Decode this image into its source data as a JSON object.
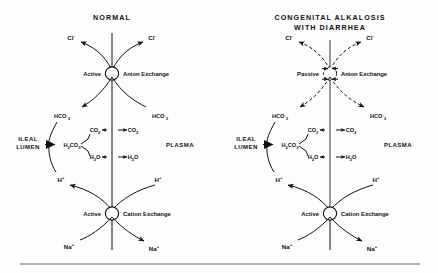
{
  "figure": {
    "panels": [
      {
        "id": "normal",
        "title": "NORMAL",
        "lumen_label": "ILEAL",
        "lumen_label2": "LUMEN",
        "plasma_label": "PLASMA",
        "anion_exchange": {
          "mode_label": "Active",
          "name_label": "Anion Exchange",
          "style": "solid"
        },
        "cation_exchange": {
          "mode_label": "Active",
          "name_label": "Cation Exchange",
          "style": "solid"
        },
        "species": {
          "chloride_lumen": "Cl",
          "chloride_plasma": "Cl",
          "bicarbonate_lumen": "HCO",
          "bicarbonate_plasma": "HCO",
          "bicarbonate_sub": "3",
          "carbonic_acid": "H",
          "carbonic_acid_sub1": "2",
          "carbonic_acid_mid": "CO",
          "carbonic_acid_sub2": "3",
          "co2_lumen": "CO",
          "co2_plasma": "CO",
          "co2_sub": "2",
          "water_lumen": "H",
          "water_plasma": "H",
          "water_sub": "2",
          "water_o": "O",
          "proton_lumen": "H",
          "proton_plasma": "H",
          "sodium_lumen": "Na",
          "sodium_plasma": "Na",
          "minus": "-",
          "plus": "+"
        }
      },
      {
        "id": "congenital-alkalosis",
        "title": "CONGENITAL  ALKALOSIS",
        "title2": "WITH  DIARRHEA",
        "lumen_label": "ILEAL",
        "lumen_label2": "LUMEN",
        "plasma_label": "PLASMA",
        "anion_exchange": {
          "mode_label": "Passive",
          "name_label": "Anion Exchange",
          "style": "dashed"
        },
        "cation_exchange": {
          "mode_label": "Active",
          "name_label": "Cation Exchange",
          "style": "solid"
        },
        "species": {
          "chloride_lumen": "Cl",
          "chloride_plasma": "Cl",
          "bicarbonate_lumen": "HCO",
          "bicarbonate_plasma": "HCO",
          "bicarbonate_sub": "3",
          "carbonic_acid": "H",
          "carbonic_acid_sub1": "2",
          "carbonic_acid_mid": "CO",
          "carbonic_acid_sub2": "3",
          "co2_lumen": "CO",
          "co2_plasma": "CO",
          "co2_sub": "2",
          "water_lumen": "H",
          "water_plasma": "H",
          "water_sub": "2",
          "water_o": "O",
          "proton_lumen": "H",
          "proton_plasma": "H",
          "sodium_lumen": "Na",
          "sodium_plasma": "Na",
          "minus": "-",
          "plus": "+"
        }
      }
    ],
    "colors": {
      "ink": "#111111",
      "rule": "#6a6a6a",
      "background": "#fdfdfd"
    }
  }
}
